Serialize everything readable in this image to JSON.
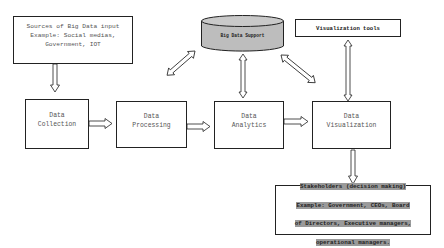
{
  "diagram": {
    "nodes": {
      "sources": {
        "label": "Sources of Big Data input\nExample: Social medias,\nGovernment, IOT"
      },
      "big_data_support": {
        "label": "Big Data Support",
        "shape": "cylinder",
        "fill": "#bdbdbd"
      },
      "visualization_tools": {
        "label": "Visualization tools"
      },
      "data_collection": {
        "label": "Data\nCollection"
      },
      "data_processing": {
        "label": "Data\nProcessing"
      },
      "data_analytics": {
        "label": "Data\nAnalytics"
      },
      "data_visualization": {
        "label": "Data\nVisualization"
      },
      "stakeholders": {
        "lines": [
          "Stakeholders (decision making)",
          "Example: Government, CEOs, Board",
          "of Directors, Executive managers,",
          "operational managers."
        ],
        "highlight": "#9a9a9a"
      }
    },
    "edges": [
      {
        "from": "Sources of Big Data input",
        "to": "Data Collection",
        "type": "one-way"
      },
      {
        "from": "Data Collection",
        "to": "Data Processing",
        "type": "one-way"
      },
      {
        "from": "Data Processing",
        "to": "Data Analytics",
        "type": "one-way"
      },
      {
        "from": "Data Analytics",
        "to": "Data Visualization",
        "type": "one-way"
      },
      {
        "from": "Data Visualization",
        "to": "Stakeholders",
        "type": "one-way"
      },
      {
        "from": "Big Data Support",
        "to": "Data Processing",
        "type": "two-way"
      },
      {
        "from": "Big Data Support",
        "to": "Data Analytics",
        "type": "two-way"
      },
      {
        "from": "Big Data Support",
        "to": "Data Visualization",
        "type": "two-way"
      },
      {
        "from": "Visualization tools",
        "to": "Data Visualization",
        "type": "two-way"
      }
    ]
  }
}
